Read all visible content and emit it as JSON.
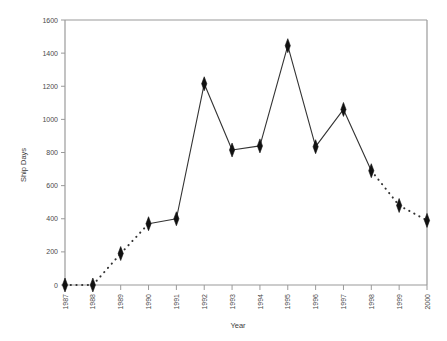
{
  "chart_data": {
    "type": "line",
    "title": "",
    "xlabel": "Year",
    "ylabel": "Ship Days",
    "categories": [
      "1987",
      "1988",
      "1989",
      "1990",
      "1991",
      "1992",
      "1993",
      "1994",
      "1995",
      "1996",
      "1997",
      "1998",
      "1999",
      "2000"
    ],
    "values": [
      0,
      0,
      190,
      370,
      400,
      1215,
      815,
      840,
      1445,
      835,
      1060,
      690,
      480,
      390
    ],
    "series": [
      {
        "name": "Ship Days",
        "values": [
          0,
          0,
          190,
          370,
          400,
          1215,
          815,
          840,
          1445,
          835,
          1060,
          690,
          480,
          390
        ]
      }
    ],
    "xlim": [
      "1987",
      "2000"
    ],
    "ylim": [
      0,
      1600
    ],
    "ytick_values": [
      0,
      200,
      400,
      600,
      800,
      1000,
      1200,
      1400,
      1600
    ],
    "ytick_labels": [
      "0",
      "200",
      "400",
      "600",
      "800",
      "1000",
      "1200",
      "1400",
      "1600"
    ],
    "xtick_labels": [
      "1987",
      "1988",
      "1989",
      "1990",
      "1991",
      "1992",
      "1993",
      "1994",
      "1995",
      "1996",
      "1997",
      "1998",
      "1999",
      "2000"
    ],
    "grid": false,
    "legend": "none",
    "marker": "diamond",
    "marker_color": "#111111",
    "line_color": "#333333",
    "segment_styles": [
      "dotted",
      "dotted",
      "dotted",
      "solid",
      "solid",
      "solid",
      "solid",
      "solid",
      "solid",
      "solid",
      "solid",
      "dotted",
      "dotted"
    ],
    "axis_color": "#9a9a9a",
    "xtick_label_rotation": -90
  }
}
